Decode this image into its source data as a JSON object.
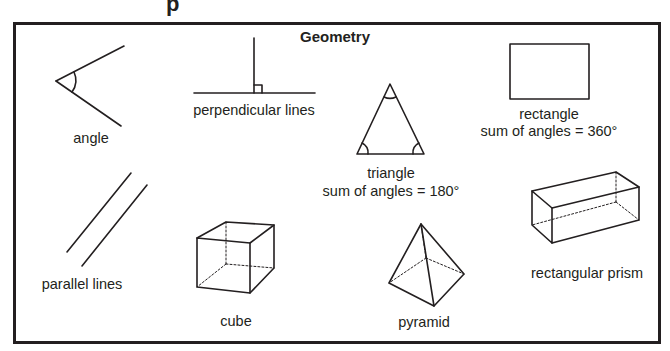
{
  "diagram": {
    "title": "Geometry",
    "top_fragment": "p",
    "colors": {
      "stroke": "#231f20",
      "background": "#ffffff"
    },
    "shapes": [
      {
        "id": "angle",
        "label": "angle",
        "sublabel": null
      },
      {
        "id": "perpendicular",
        "label": "perpendicular lines",
        "sublabel": null
      },
      {
        "id": "triangle",
        "label": "triangle",
        "sublabel": "sum of angles = 180°"
      },
      {
        "id": "rectangle",
        "label": "rectangle",
        "sublabel": "sum of angles = 360°"
      },
      {
        "id": "parallel",
        "label": "parallel lines",
        "sublabel": null
      },
      {
        "id": "cube",
        "label": "cube",
        "sublabel": null
      },
      {
        "id": "pyramid",
        "label": "pyramid",
        "sublabel": null
      },
      {
        "id": "rectangular-prism",
        "label": "rectangular prism",
        "sublabel": null
      }
    ]
  }
}
